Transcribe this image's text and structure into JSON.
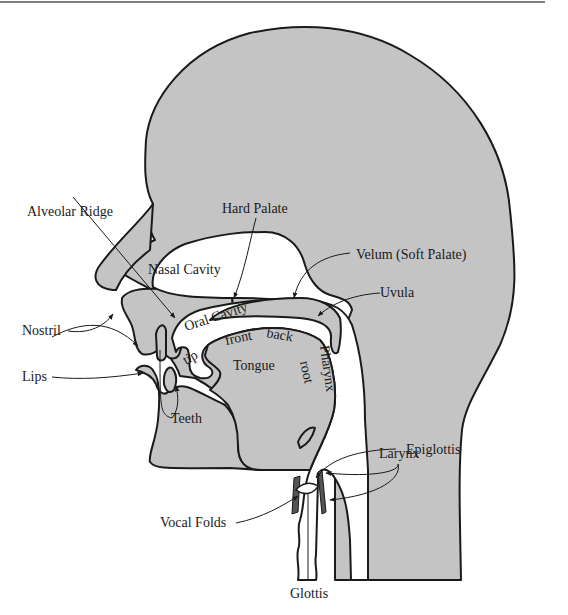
{
  "figure": {
    "colors": {
      "tissue": "#c4c4c4",
      "cavity": "#ffffff",
      "outline": "#1a1a1a",
      "cartilage": "#555555",
      "rule": "#555555"
    }
  },
  "labels": {
    "alveolar_ridge": "Alveolar Ridge",
    "hard_palate": "Hard Palate",
    "nasal_cavity": "Nasal Cavity",
    "velum": "Velum (Soft Palate)",
    "uvula": "Uvula",
    "nostril": "Nostril",
    "oral_cavity": "Oral Cavity",
    "lips": "Lips",
    "tip": "tip",
    "front": "front",
    "back": "back",
    "tongue": "Tongue",
    "root": "root",
    "pharynx": "Pharynx",
    "teeth": "Teeth",
    "epiglottis": "Epiglottis",
    "larynx": "Larynx",
    "vocal_folds": "Vocal Folds",
    "glottis": "Glottis"
  }
}
